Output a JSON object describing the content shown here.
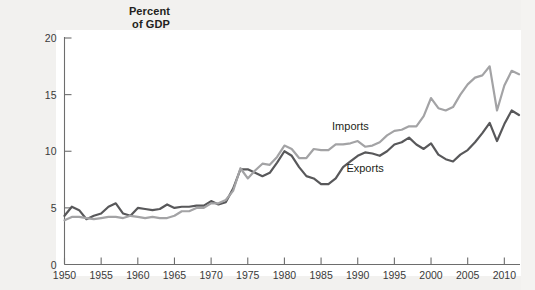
{
  "figure": {
    "axis_title_line1": "Percent",
    "axis_title_line2": "of GDP",
    "background_color": "#ffffff",
    "margin_color": "#f2f1ef"
  },
  "chart_data": {
    "type": "line",
    "title": "",
    "subtitle": "",
    "xlabel": "",
    "ylabel": "Percent of GDP",
    "xlim": [
      1950,
      2012
    ],
    "ylim": [
      0,
      20
    ],
    "grid": false,
    "legend_position": "inline-annotation",
    "xticks": [
      1950,
      1955,
      1960,
      1965,
      1970,
      1975,
      1980,
      1985,
      1990,
      1995,
      2000,
      2005,
      2010
    ],
    "yticks": [
      0,
      5,
      10,
      15,
      20
    ],
    "annotations": [
      {
        "text": "Imports",
        "x": 1989,
        "y": 11.9
      },
      {
        "text": "Exports",
        "x": 1991,
        "y": 8.2
      }
    ],
    "x": [
      1950,
      1951,
      1952,
      1953,
      1954,
      1955,
      1956,
      1957,
      1958,
      1959,
      1960,
      1961,
      1962,
      1963,
      1964,
      1965,
      1966,
      1967,
      1968,
      1969,
      1970,
      1971,
      1972,
      1973,
      1974,
      1975,
      1976,
      1977,
      1978,
      1979,
      1980,
      1981,
      1982,
      1983,
      1984,
      1985,
      1986,
      1987,
      1988,
      1989,
      1990,
      1991,
      1992,
      1993,
      1994,
      1995,
      1996,
      1997,
      1998,
      1999,
      2000,
      2001,
      2002,
      2003,
      2004,
      2005,
      2006,
      2007,
      2008,
      2009,
      2010,
      2011,
      2012
    ],
    "series": [
      {
        "name": "Exports",
        "color": "#58585a",
        "values": [
          4.3,
          5.1,
          4.8,
          4.0,
          4.3,
          4.5,
          5.1,
          5.4,
          4.5,
          4.3,
          5.0,
          4.9,
          4.8,
          4.9,
          5.3,
          5.0,
          5.1,
          5.1,
          5.2,
          5.2,
          5.6,
          5.3,
          5.5,
          6.7,
          8.4,
          8.4,
          8.1,
          7.8,
          8.1,
          9.0,
          10.0,
          9.6,
          8.6,
          7.8,
          7.6,
          7.1,
          7.1,
          7.6,
          8.6,
          9.1,
          9.6,
          9.9,
          9.8,
          9.6,
          10.0,
          10.6,
          10.8,
          11.2,
          10.6,
          10.2,
          10.7,
          9.7,
          9.3,
          9.1,
          9.7,
          10.1,
          10.8,
          11.6,
          12.5,
          10.9,
          12.4,
          13.6,
          13.2
        ]
      },
      {
        "name": "Imports",
        "color": "#a3a3a5",
        "values": [
          3.9,
          4.2,
          4.2,
          4.1,
          4.0,
          4.1,
          4.2,
          4.2,
          4.1,
          4.3,
          4.2,
          4.1,
          4.2,
          4.1,
          4.1,
          4.3,
          4.7,
          4.7,
          5.0,
          5.0,
          5.4,
          5.4,
          5.7,
          6.5,
          8.5,
          7.6,
          8.3,
          8.9,
          8.8,
          9.5,
          10.5,
          10.2,
          9.4,
          9.4,
          10.2,
          10.1,
          10.1,
          10.6,
          10.6,
          10.7,
          10.9,
          10.4,
          10.5,
          10.8,
          11.4,
          11.8,
          11.9,
          12.2,
          12.2,
          13.1,
          14.7,
          13.8,
          13.6,
          13.9,
          15.0,
          15.9,
          16.5,
          16.7,
          17.5,
          13.6,
          15.8,
          17.1,
          16.8
        ]
      }
    ]
  }
}
